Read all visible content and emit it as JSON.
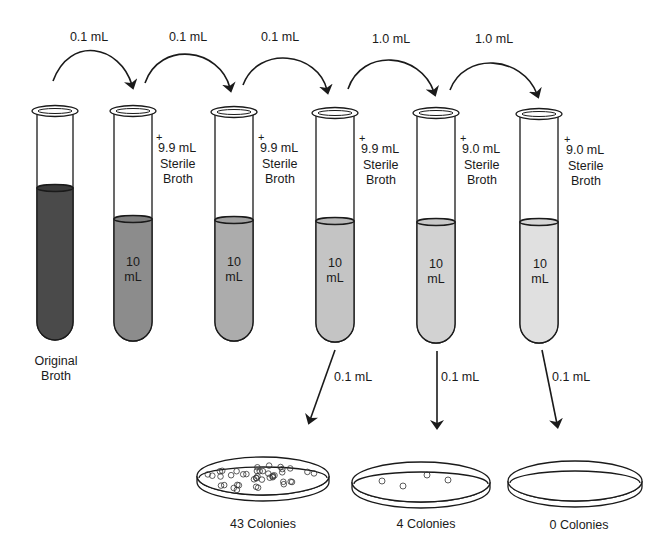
{
  "figure": {
    "transfers": [
      {
        "label": "0.1 mL",
        "from": "original",
        "to": "tube-1"
      },
      {
        "label": "0.1 mL",
        "from": "tube-1",
        "to": "tube-2"
      },
      {
        "label": "0.1 mL",
        "from": "tube-2",
        "to": "tube-3"
      },
      {
        "label": "1.0 mL",
        "from": "tube-3",
        "to": "tube-4"
      },
      {
        "label": "1.0 mL",
        "from": "tube-4",
        "to": "tube-5"
      }
    ],
    "tubes": [
      {
        "id": "original",
        "label_line1": "Original",
        "label_line2": "Broth",
        "fill_color": "#4a4a4a"
      },
      {
        "id": "tube-1",
        "diluent_plus": "+",
        "diluent_volume": "9.9 mL",
        "diluent_line2": "Sterile",
        "diluent_line3": "Broth",
        "volume_line1": "10",
        "volume_line2": "mL",
        "fill_color": "#8c8c8c"
      },
      {
        "id": "tube-2",
        "diluent_plus": "+",
        "diluent_volume": "9.9 mL",
        "diluent_line2": "Sterile",
        "diluent_line3": "Broth",
        "volume_line1": "10",
        "volume_line2": "mL",
        "fill_color": "#acacac"
      },
      {
        "id": "tube-3",
        "diluent_plus": "+",
        "diluent_volume": "9.9 mL",
        "diluent_line2": "Sterile",
        "diluent_line3": "Broth",
        "volume_line1": "10",
        "volume_line2": "mL",
        "fill_color": "#c4c4c4"
      },
      {
        "id": "tube-4",
        "diluent_plus": "+",
        "diluent_volume": "9.0 mL",
        "diluent_line2": "Sterile",
        "diluent_line3": "Broth",
        "volume_line1": "10",
        "volume_line2": "mL",
        "fill_color": "#d2d2d2"
      },
      {
        "id": "tube-5",
        "diluent_plus": "+",
        "diluent_volume": "9.0 mL",
        "diluent_line2": "Sterile",
        "diluent_line3": "Broth",
        "volume_line1": "10",
        "volume_line2": "mL",
        "fill_color": "#e0e0e0"
      }
    ],
    "platings": [
      {
        "from": "tube-3",
        "volume": "0.1 mL",
        "colonies_label": "43 Colonies",
        "colony_count": 43
      },
      {
        "from": "tube-4",
        "volume": "0.1 mL",
        "colonies_label": "4 Colonies",
        "colony_count": 4
      },
      {
        "from": "tube-5",
        "volume": "0.1 mL",
        "colonies_label": "0 Colonies",
        "colony_count": 0
      }
    ],
    "colors": {
      "line": "#1a1a1a",
      "background": "#ffffff"
    }
  }
}
